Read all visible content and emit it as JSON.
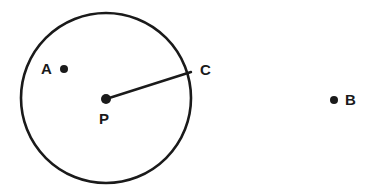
{
  "figure": {
    "background_color": "#ffffff",
    "stroke_color": "#1a1a1a",
    "canvas": {
      "width": 381,
      "height": 194
    },
    "circle": {
      "name": "circle-P",
      "center_x": 106,
      "center_y": 98,
      "radius": 85,
      "stroke_width": 2.6,
      "fill": "none"
    },
    "radius_segment": {
      "name": "segment-PC",
      "from": "P",
      "to": "C",
      "x1": 106,
      "y1": 99,
      "x2": 191,
      "y2": 72,
      "stroke_width": 2.4
    },
    "points": [
      {
        "id": "A",
        "label": "A",
        "x": 64,
        "y": 69,
        "dot_radius": 4,
        "label_position": "left",
        "location": "interior"
      },
      {
        "id": "P",
        "label": "P",
        "x": 106,
        "y": 99,
        "dot_radius": 5,
        "label_position": "below",
        "location": "center"
      },
      {
        "id": "C",
        "label": "C",
        "x": 191,
        "y": 72,
        "dot_radius": 0,
        "label_position": "right",
        "location": "on-circle"
      },
      {
        "id": "B",
        "label": "B",
        "x": 334,
        "y": 100,
        "dot_radius": 4,
        "label_position": "right",
        "location": "exterior"
      }
    ]
  }
}
